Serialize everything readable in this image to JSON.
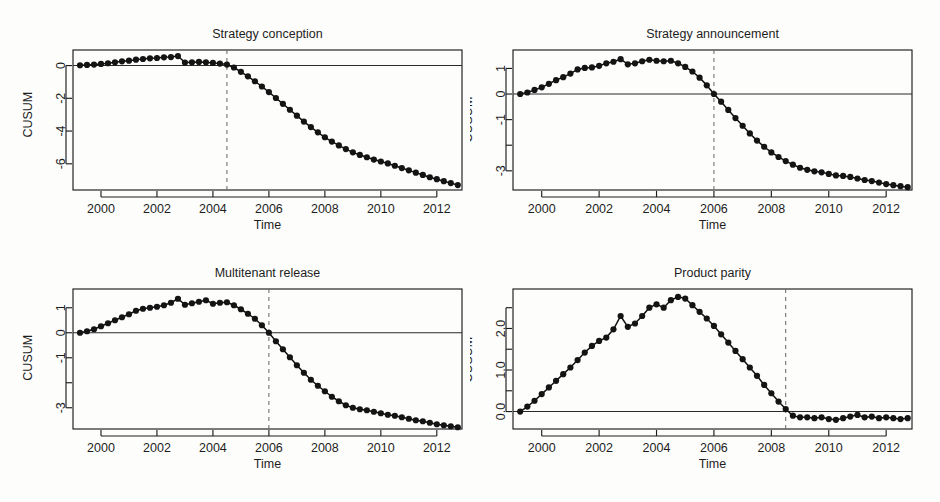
{
  "figure": {
    "background": "#fdfdfc",
    "ink": "#1d1d1d",
    "point_color": "#141414",
    "break_line_color": "#6d6d6d",
    "width": 940,
    "height": 502
  },
  "panels": [
    {
      "key": "strategy-conception",
      "title": "Strategy conception",
      "xlabel": "Time",
      "ylabel": "CUSUM"
    },
    {
      "key": "strategy-announcement",
      "title": "Strategy announcement",
      "xlabel": "Time",
      "ylabel": "CUSUM"
    },
    {
      "key": "multitenant-release",
      "title": "Multitenant release",
      "xlabel": "Time",
      "ylabel": "CUSUM"
    },
    {
      "key": "product-parity",
      "title": "Product parity",
      "xlabel": "Time",
      "ylabel": "CUSUM"
    }
  ],
  "chart_data": [
    {
      "type": "line",
      "key": "strategy-conception",
      "title": "Strategy conception",
      "xlabel": "Time",
      "ylabel": "CUSUM",
      "grid": false,
      "legend": "none",
      "xlim": [
        1999.0,
        1912.9
      ],
      "x_range": [
        1999.0,
        2012.9
      ],
      "ylim": [
        -7.6,
        0.95
      ],
      "xticks": [
        2000,
        2002,
        2004,
        2006,
        2008,
        2010,
        2012
      ],
      "xtick_labels": [
        "2000",
        "2002",
        "2004",
        "2006",
        "2008",
        "2010",
        "2012"
      ],
      "yticks": [
        0,
        -2,
        -4,
        -6
      ],
      "ytick_labels": [
        "0",
        "-2",
        "-4",
        "-6"
      ],
      "zero_line": 0,
      "break_line_x": 2004.5,
      "x": [
        1999.25,
        1999.5,
        1999.75,
        2000.0,
        2000.25,
        2000.5,
        2000.75,
        2001.0,
        2001.25,
        2001.5,
        2001.75,
        2002.0,
        2002.25,
        2002.5,
        2002.75,
        2003.0,
        2003.25,
        2003.5,
        2003.75,
        2004.0,
        2004.25,
        2004.5,
        2004.75,
        2005.0,
        2005.25,
        2005.5,
        2005.75,
        2006.0,
        2006.25,
        2006.5,
        2006.75,
        2007.0,
        2007.25,
        2007.5,
        2007.75,
        2008.0,
        2008.25,
        2008.5,
        2008.75,
        2009.0,
        2009.25,
        2009.5,
        2009.75,
        2010.0,
        2010.25,
        2010.5,
        2010.75,
        2011.0,
        2011.25,
        2011.5,
        2011.75,
        2012.0,
        2012.25,
        2012.5,
        2012.75
      ],
      "y": [
        0.02,
        0.04,
        0.06,
        0.1,
        0.14,
        0.2,
        0.26,
        0.3,
        0.36,
        0.4,
        0.44,
        0.46,
        0.5,
        0.52,
        0.58,
        0.18,
        0.2,
        0.22,
        0.2,
        0.16,
        0.12,
        0.06,
        -0.12,
        -0.38,
        -0.66,
        -0.96,
        -1.28,
        -1.62,
        -1.98,
        -2.34,
        -2.7,
        -3.06,
        -3.42,
        -3.76,
        -4.08,
        -4.38,
        -4.64,
        -4.88,
        -5.1,
        -5.3,
        -5.46,
        -5.6,
        -5.74,
        -5.86,
        -5.98,
        -6.12,
        -6.26,
        -6.4,
        -6.54,
        -6.68,
        -6.82,
        -6.94,
        -7.06,
        -7.18,
        -7.3
      ]
    },
    {
      "type": "line",
      "key": "strategy-announcement",
      "title": "Strategy announcement",
      "xlabel": "Time",
      "ylabel": "CUSUM",
      "grid": false,
      "legend": "none",
      "x_range": [
        1999.0,
        2012.9
      ],
      "ylim": [
        -3.75,
        1.72
      ],
      "xticks": [
        2000,
        2002,
        2004,
        2006,
        2008,
        2010,
        2012
      ],
      "xtick_labels": [
        "2000",
        "2002",
        "2004",
        "2006",
        "2008",
        "2010",
        "2012"
      ],
      "yticks": [
        1,
        0,
        -1,
        -2,
        -3
      ],
      "ytick_labels": [
        "1",
        "0",
        "-1",
        "",
        "-3"
      ],
      "zero_line": 0,
      "break_line_x": 2006.0,
      "x": [
        1999.25,
        1999.5,
        1999.75,
        2000.0,
        2000.25,
        2000.5,
        2000.75,
        2001.0,
        2001.25,
        2001.5,
        2001.75,
        2002.0,
        2002.25,
        2002.5,
        2002.75,
        2003.0,
        2003.25,
        2003.5,
        2003.75,
        2004.0,
        2004.25,
        2004.5,
        2004.75,
        2005.0,
        2005.25,
        2005.5,
        2005.75,
        2006.0,
        2006.25,
        2006.5,
        2006.75,
        2007.0,
        2007.25,
        2007.5,
        2007.75,
        2008.0,
        2008.25,
        2008.5,
        2008.75,
        2009.0,
        2009.25,
        2009.5,
        2009.75,
        2010.0,
        2010.25,
        2010.5,
        2010.75,
        2011.0,
        2011.25,
        2011.5,
        2011.75,
        2012.0,
        2012.25,
        2012.5,
        2012.75
      ],
      "y": [
        0.0,
        0.06,
        0.16,
        0.26,
        0.4,
        0.54,
        0.66,
        0.8,
        0.96,
        1.02,
        1.04,
        1.1,
        1.2,
        1.26,
        1.36,
        1.16,
        1.2,
        1.28,
        1.34,
        1.3,
        1.28,
        1.3,
        1.2,
        1.06,
        0.88,
        0.64,
        0.34,
        0.0,
        -0.3,
        -0.62,
        -0.94,
        -1.24,
        -1.54,
        -1.82,
        -2.06,
        -2.28,
        -2.46,
        -2.62,
        -2.76,
        -2.88,
        -2.96,
        -3.02,
        -3.06,
        -3.12,
        -3.18,
        -3.2,
        -3.24,
        -3.3,
        -3.36,
        -3.4,
        -3.46,
        -3.52,
        -3.56,
        -3.6,
        -3.64
      ]
    },
    {
      "type": "line",
      "key": "multitenant-release",
      "title": "Multitenant release",
      "xlabel": "Time",
      "ylabel": "CUSUM",
      "grid": false,
      "legend": "none",
      "x_range": [
        1999.0,
        2012.9
      ],
      "ylim": [
        -3.85,
        1.75
      ],
      "xticks": [
        2000,
        2002,
        2004,
        2006,
        2008,
        2010,
        2012
      ],
      "xtick_labels": [
        "2000",
        "2002",
        "2004",
        "2006",
        "2008",
        "2010",
        "2012"
      ],
      "yticks": [
        1,
        0,
        -1,
        -2,
        -3
      ],
      "ytick_labels": [
        "1",
        "0",
        "-1",
        "",
        "-3"
      ],
      "zero_line": 0,
      "break_line_x": 2006.0,
      "x": [
        1999.25,
        1999.5,
        1999.75,
        2000.0,
        2000.25,
        2000.5,
        2000.75,
        2001.0,
        2001.25,
        2001.5,
        2001.75,
        2002.0,
        2002.25,
        2002.5,
        2002.75,
        2003.0,
        2003.25,
        2003.5,
        2003.75,
        2004.0,
        2004.25,
        2004.5,
        2004.75,
        2005.0,
        2005.25,
        2005.5,
        2005.75,
        2006.0,
        2006.25,
        2006.5,
        2006.75,
        2007.0,
        2007.25,
        2007.5,
        2007.75,
        2008.0,
        2008.25,
        2008.5,
        2008.75,
        2009.0,
        2009.25,
        2009.5,
        2009.75,
        2010.0,
        2010.25,
        2010.5,
        2010.75,
        2011.0,
        2011.25,
        2011.5,
        2011.75,
        2012.0,
        2012.25,
        2012.5,
        2012.75
      ],
      "y": [
        0.0,
        0.06,
        0.14,
        0.26,
        0.38,
        0.5,
        0.62,
        0.74,
        0.88,
        0.96,
        1.0,
        1.04,
        1.1,
        1.2,
        1.36,
        1.12,
        1.18,
        1.24,
        1.3,
        1.16,
        1.2,
        1.22,
        1.1,
        0.94,
        0.76,
        0.56,
        0.3,
        0.0,
        -0.34,
        -0.66,
        -0.98,
        -1.3,
        -1.6,
        -1.88,
        -2.12,
        -2.34,
        -2.56,
        -2.74,
        -2.9,
        -3.0,
        -3.06,
        -3.1,
        -3.16,
        -3.22,
        -3.28,
        -3.32,
        -3.38,
        -3.44,
        -3.5,
        -3.54,
        -3.6,
        -3.66,
        -3.7,
        -3.74,
        -3.78
      ]
    },
    {
      "type": "line",
      "key": "product-parity",
      "title": "Product parity",
      "xlabel": "Time",
      "ylabel": "CUSUM",
      "grid": false,
      "legend": "none",
      "x_range": [
        1999.0,
        2012.9
      ],
      "ylim": [
        -0.42,
        2.95
      ],
      "xticks": [
        2000,
        2002,
        2004,
        2006,
        2008,
        2010,
        2012
      ],
      "xtick_labels": [
        "2000",
        "2002",
        "2004",
        "2006",
        "2008",
        "2010",
        "2012"
      ],
      "yticks": [
        0.0,
        0.5,
        1.0,
        1.5,
        2.0,
        2.5
      ],
      "ytick_labels": [
        "0.0",
        "",
        "1.0",
        "",
        "2.0",
        ""
      ],
      "zero_line": 0,
      "break_line_x": 2008.5,
      "x": [
        1999.25,
        1999.5,
        1999.75,
        2000.0,
        2000.25,
        2000.5,
        2000.75,
        2001.0,
        2001.25,
        2001.5,
        2001.75,
        2002.0,
        2002.25,
        2002.5,
        2002.75,
        2003.0,
        2003.25,
        2003.5,
        2003.75,
        2004.0,
        2004.25,
        2004.5,
        2004.75,
        2005.0,
        2005.25,
        2005.5,
        2005.75,
        2006.0,
        2006.25,
        2006.5,
        2006.75,
        2007.0,
        2007.25,
        2007.5,
        2007.75,
        2008.0,
        2008.25,
        2008.5,
        2008.75,
        2009.0,
        2009.25,
        2009.5,
        2009.75,
        2010.0,
        2010.25,
        2010.5,
        2010.75,
        2011.0,
        2011.25,
        2011.5,
        2011.75,
        2012.0,
        2012.25,
        2012.5,
        2012.75
      ],
      "y": [
        0.0,
        0.12,
        0.26,
        0.42,
        0.58,
        0.74,
        0.9,
        1.06,
        1.24,
        1.42,
        1.58,
        1.7,
        1.78,
        1.98,
        2.3,
        2.04,
        2.12,
        2.3,
        2.5,
        2.58,
        2.5,
        2.68,
        2.76,
        2.72,
        2.56,
        2.4,
        2.24,
        2.06,
        1.86,
        1.66,
        1.46,
        1.26,
        1.06,
        0.86,
        0.64,
        0.44,
        0.24,
        0.06,
        -0.1,
        -0.14,
        -0.14,
        -0.16,
        -0.14,
        -0.18,
        -0.2,
        -0.16,
        -0.12,
        -0.08,
        -0.14,
        -0.12,
        -0.16,
        -0.14,
        -0.16,
        -0.18,
        -0.16
      ]
    }
  ]
}
